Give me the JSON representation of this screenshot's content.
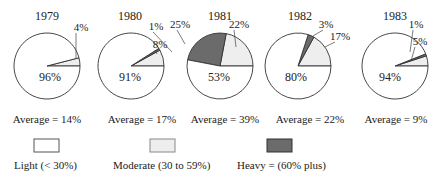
{
  "chart_data": {
    "type": "pie",
    "title": "",
    "categories": [
      "Light (< 30%)",
      "Moderate (30 to 59%)",
      "Heavy = (60% plus)"
    ],
    "colors": {
      "light": "#ffffff",
      "moderate": "#eeeeee",
      "heavy": "#6b6b6b"
    },
    "series": [
      {
        "name": "1979",
        "values": [
          96,
          4,
          0
        ],
        "labels": [
          "96%",
          "4%",
          ""
        ],
        "average": "Average = 14%"
      },
      {
        "name": "1980",
        "values": [
          91,
          8,
          1
        ],
        "labels": [
          "91%",
          "8%",
          "1%"
        ],
        "average": "Average = 17%"
      },
      {
        "name": "1981",
        "values": [
          53,
          22,
          25
        ],
        "labels": [
          "53%",
          "22%",
          "25%"
        ],
        "average": "Average = 39%"
      },
      {
        "name": "1982",
        "values": [
          80,
          17,
          3
        ],
        "labels": [
          "80%",
          "17%",
          "3%"
        ],
        "average": "Average = 22%"
      },
      {
        "name": "1983",
        "values": [
          94,
          5,
          1
        ],
        "labels": [
          "94%",
          "5%",
          "1%"
        ],
        "average": "Average = 9%"
      }
    ]
  },
  "legend": [
    {
      "label": "Light (< 30%)"
    },
    {
      "label": "Moderate (30 to 59%)"
    },
    {
      "label": "Heavy = (60% plus)"
    }
  ]
}
